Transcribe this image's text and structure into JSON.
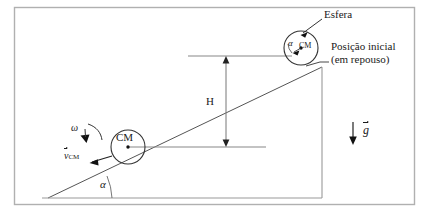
{
  "figure": {
    "width": 429,
    "height": 214,
    "background_color": "#ffffff",
    "frame_color": "#b0b0b0",
    "line_color": "#444444",
    "text_color": "#1a1a1a"
  },
  "labels": {
    "sphere_callout": "Esfera",
    "initial_position_line1": "Posição inicial",
    "initial_position_line2": "(em repouso)",
    "height": "H",
    "incline_angle": "α",
    "sphere_angle": "α",
    "center_of_mass_upper": "CM",
    "center_of_mass_lower": "CM",
    "angular_velocity": "ω",
    "velocity_symbol": "v",
    "velocity_subscript": "CM",
    "gravity_symbol": "g"
  },
  "geometry": {
    "incline_base_left_x": 48,
    "incline_base_y": 198,
    "incline_apex_x": 322,
    "incline_apex_y": 67,
    "vertical_edge_x": 322,
    "upper_sphere_center_x": 301,
    "upper_sphere_center_y": 48,
    "upper_sphere_radius": 17,
    "lower_sphere_center_x": 128,
    "lower_sphere_center_y": 147,
    "lower_sphere_radius": 17,
    "upper_reference_line_y": 56,
    "lower_reference_line_y": 147,
    "height_arrow_x": 226,
    "gravity_arrow_x": 353
  }
}
